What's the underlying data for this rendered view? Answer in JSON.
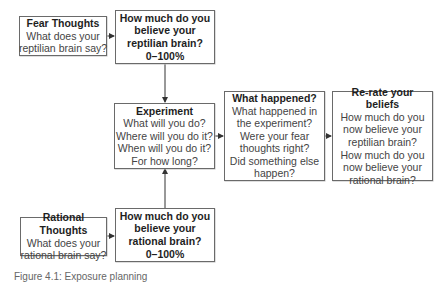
{
  "diagram": {
    "nodes": {
      "fear_thoughts": {
        "title": "Fear Thoughts",
        "lines": [
          "What does your",
          "reptilian brain say?"
        ]
      },
      "reptilian_belief": {
        "lines": [
          "How much do you",
          "believe your",
          "reptilian brain?",
          "0–100%"
        ]
      },
      "experiment": {
        "title": "Experiment",
        "lines": [
          "What will you do?",
          "Where will you do it?",
          "When will you do it?",
          "For how long?"
        ]
      },
      "what_happened": {
        "title": "What happened?",
        "lines": [
          "What happened in",
          "the experiment?",
          "Were your fear",
          "thoughts right?",
          "Did something else",
          "happen?"
        ]
      },
      "rerate_beliefs": {
        "title": "Re-rate your beliefs",
        "lines": [
          "How much do you",
          "now believe your",
          "reptilian brain?",
          "How much do you",
          "now believe your",
          "rational brain?"
        ]
      },
      "rational_thoughts": {
        "title": "Rational Thoughts",
        "lines": [
          "What does your",
          "rational brain say?"
        ]
      },
      "rational_belief": {
        "lines": [
          "How much do you",
          "believe your",
          "rational brain?",
          "0–100%"
        ]
      }
    },
    "edges": [
      {
        "from": "fear_thoughts",
        "to": "reptilian_belief"
      },
      {
        "from": "reptilian_belief",
        "to": "experiment"
      },
      {
        "from": "rational_thoughts",
        "to": "rational_belief"
      },
      {
        "from": "rational_belief",
        "to": "experiment"
      },
      {
        "from": "experiment",
        "to": "what_happened"
      },
      {
        "from": "what_happened",
        "to": "rerate_beliefs"
      }
    ],
    "colors": {
      "border": "#6a6a6a",
      "arrow": "#333333",
      "text": "#3a3a3a"
    }
  },
  "caption": {
    "text": "Figure 4.1: Exposure planning"
  }
}
